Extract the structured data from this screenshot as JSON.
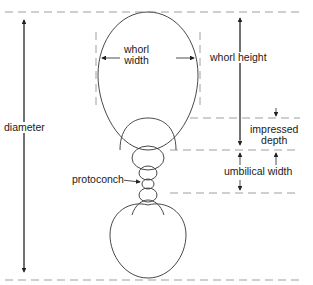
{
  "diagram": {
    "type": "ammonite shell cross-section measurement diagram",
    "colors": {
      "line": "#333333",
      "dash": "#777777",
      "background": "#ffffff"
    },
    "labels": {
      "whorl_width": [
        "whorl",
        "width"
      ],
      "whorl_height": "whorl height",
      "diameter": "diameter",
      "impressed_depth": [
        "impressed",
        "depth"
      ],
      "umbilical_width": "umbilical width",
      "protoconch": "protoconch"
    }
  }
}
